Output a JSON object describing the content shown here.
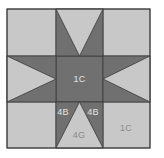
{
  "diagram": {
    "type": "quilt-block",
    "colors": {
      "light": "#c8c8c8",
      "dark": "#707070",
      "outline": "#3a3a3a",
      "label_on_dark": "#e2e2e2",
      "label_on_light": "#8a8a8a"
    },
    "grid": {
      "rows": 3,
      "cols": 3
    },
    "labels": {
      "center": "1C",
      "bottom_left_star_point": "4B",
      "bottom_right_star_point": "4B",
      "bottom_middle_triangle": "4G",
      "bottom_right_corner": "1C"
    }
  }
}
